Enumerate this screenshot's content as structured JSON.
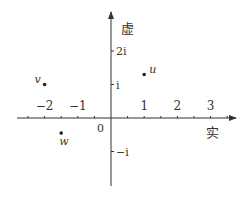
{
  "diagram": {
    "type": "complex-plane",
    "axes": {
      "real_label": "实",
      "imag_label": "虚",
      "origin_label": "0",
      "real_ticks": [
        {
          "value": -2,
          "label": "−2"
        },
        {
          "value": -1,
          "label": "−1"
        },
        {
          "value": 1,
          "label": "1"
        },
        {
          "value": 2,
          "label": "2"
        },
        {
          "value": 3,
          "label": "3"
        }
      ],
      "imag_ticks": [
        {
          "value": 2,
          "label": "2i"
        },
        {
          "value": 1,
          "label": "i"
        },
        {
          "value": -1,
          "label": "−i"
        }
      ]
    },
    "points": [
      {
        "name": "v",
        "re": -2,
        "im": 1
      },
      {
        "name": "u",
        "re": 1,
        "im": 1.3
      },
      {
        "name": "w",
        "re": -1.5,
        "im": -0.45
      }
    ],
    "color": "#333333"
  }
}
